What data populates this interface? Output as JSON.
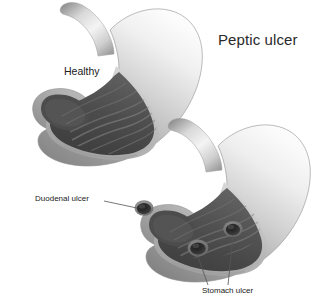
{
  "figure": {
    "title": "Peptic ulcer",
    "background_color": "#ffffff",
    "type": "medical-illustration",
    "labels": {
      "healthy": "Healthy",
      "duodenal_ulcer": "Duodenal ulcer",
      "stomach_ulcer": "Stomach ulcer"
    },
    "colors": {
      "outer_wall_light": "#f2f2f2",
      "outer_wall_mid": "#b4b4b4",
      "outer_wall_dark": "#7e7e7e",
      "inner_cavity_dark": "#4a4a4a",
      "inner_cavity_mid": "#5e5e5e",
      "rugae_line": "#6e6e6e",
      "ulcer_crater": "#2e2e2e",
      "leader_line": "#555555",
      "text": "#1d1d1d"
    },
    "diagrams": [
      {
        "name": "healthy-stomach",
        "label": "Healthy",
        "condition": "normal",
        "ulcer_count": 0,
        "parts": [
          "esophagus",
          "fundus",
          "body",
          "rugae",
          "antrum",
          "pylorus",
          "duodenum"
        ]
      },
      {
        "name": "ulcerated-stomach",
        "label": "Peptic ulcer",
        "condition": "peptic ulcer disease",
        "ulcer_count": 3,
        "parts": [
          "esophagus",
          "fundus",
          "body",
          "rugae",
          "antrum",
          "pylorus",
          "duodenum"
        ],
        "ulcers": [
          {
            "name": "duodenal-ulcer",
            "label": "Duodenal ulcer",
            "location": "duodenum"
          },
          {
            "name": "stomach-ulcer-antrum",
            "label": "Stomach ulcer",
            "location": "antrum"
          },
          {
            "name": "stomach-ulcer-body",
            "label": "Stomach ulcer",
            "location": "lesser curvature"
          }
        ]
      }
    ]
  }
}
